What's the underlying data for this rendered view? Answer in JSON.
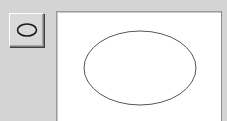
{
  "toolbar": {
    "tools": [
      {
        "name": "ellipse-tool",
        "icon": "ellipse-icon",
        "selected": false
      }
    ]
  },
  "canvas": {
    "background": "#ffffff",
    "shapes": [
      {
        "type": "ellipse",
        "cx": 139,
        "cy": 67,
        "rx": 56,
        "ry": 37,
        "stroke": "#555555",
        "fill": "none"
      }
    ]
  },
  "colors": {
    "window_background": "#d4d4d4",
    "canvas_background": "#ffffff",
    "shape_stroke": "#555555"
  }
}
